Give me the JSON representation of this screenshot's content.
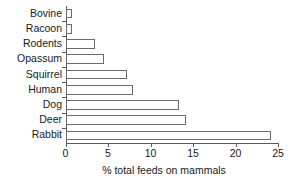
{
  "chart_data": {
    "type": "bar",
    "orientation": "horizontal",
    "title": "",
    "xlabel": "% total feeds on mammals",
    "ylabel": "",
    "xlim": [
      0,
      25
    ],
    "xticks": [
      0,
      5,
      10,
      15,
      20,
      25
    ],
    "xtick_labels": [
      "0",
      "5",
      "10",
      "15",
      "20",
      "25"
    ],
    "grid": false,
    "legend": false,
    "bar_fill_color": "#ffffff",
    "bar_edge_color": "#6b6b6b",
    "axis_color": "#5a5a5a",
    "categories": [
      "Bovine",
      "Racoon",
      "Rodents",
      "Opassum",
      "Squirrel",
      "Human",
      "Dog",
      "Deer",
      "Rabbit"
    ],
    "values": [
      0.8,
      0.8,
      3.5,
      4.5,
      7.2,
      7.9,
      13.4,
      14.2,
      24.2
    ]
  }
}
